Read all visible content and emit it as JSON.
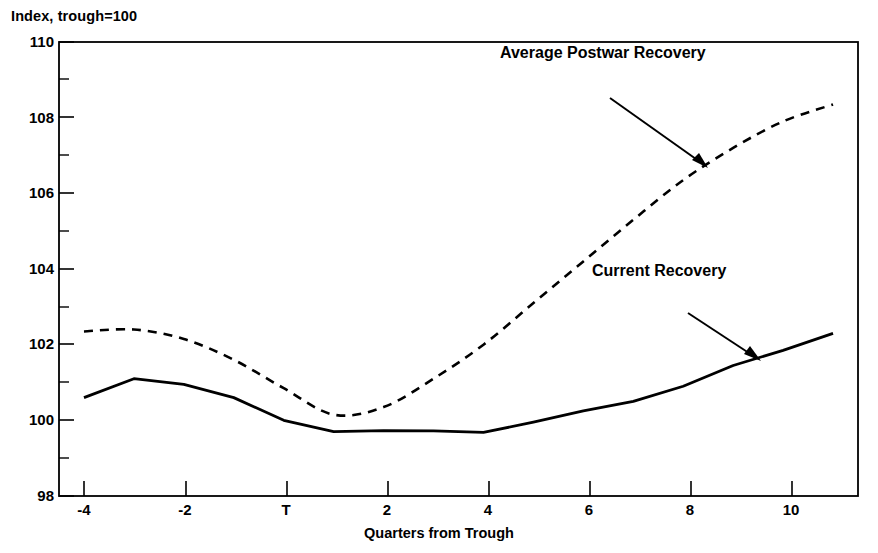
{
  "figure": {
    "units_note": "Index, trough=100",
    "xaxis_title": "Quarters from Trough"
  },
  "annotations": {
    "average": "Average Postwar Recovery",
    "current": "Current Recovery"
  },
  "chart_data": {
    "type": "line",
    "title": "",
    "subtitle": "",
    "xlabel": "Quarters from Trough",
    "ylabel": "Index, trough=100",
    "xlim": [
      -4.5,
      11.5
    ],
    "ylim": [
      98,
      110
    ],
    "grid": false,
    "legend_position": "inline-annotations",
    "xticks": [
      -4,
      -2,
      0,
      2,
      4,
      6,
      8,
      10
    ],
    "xticklabels": [
      "-4",
      "-2",
      "T",
      "2",
      "4",
      "6",
      "8",
      "10"
    ],
    "yticks": [
      98,
      100,
      102,
      104,
      106,
      108,
      110
    ],
    "yticklabels": [
      "98",
      "100",
      "102",
      "104",
      "106",
      "108",
      "110"
    ],
    "yminorticks": [
      99,
      101,
      103,
      105,
      107,
      109
    ],
    "x": [
      -4,
      -3,
      -2,
      -1,
      0,
      1,
      2,
      3,
      4,
      5,
      6,
      7,
      8,
      9,
      10,
      11
    ],
    "series": [
      {
        "name": "Average Postwar Recovery",
        "style": "dashed",
        "color": "#000000",
        "values": [
          102.35,
          102.4,
          102.15,
          101.6,
          100.85,
          100.15,
          100.35,
          101.1,
          102.0,
          103.1,
          104.2,
          105.3,
          106.35,
          107.2,
          107.9,
          108.35
        ]
      },
      {
        "name": "Current Recovery",
        "style": "solid",
        "color": "#000000",
        "values": [
          100.6,
          101.1,
          100.95,
          100.6,
          100.0,
          99.7,
          99.73,
          99.72,
          99.68,
          99.95,
          100.25,
          100.5,
          100.9,
          101.45,
          101.85,
          102.3
        ]
      }
    ]
  }
}
